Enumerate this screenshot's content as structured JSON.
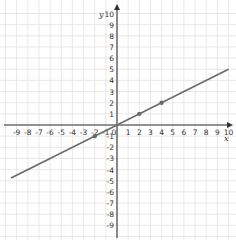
{
  "chart_data": {
    "type": "line",
    "title": "",
    "xlabel": "x",
    "ylabel": "y",
    "xlim": [
      -9.5,
      10.3
    ],
    "ylim": [
      -10,
      10.5
    ],
    "grid": true,
    "x_ticks": [
      -9,
      -8,
      -7,
      -6,
      -5,
      -4,
      -3,
      -2,
      -1,
      0,
      1,
      2,
      3,
      4,
      5,
      6,
      7,
      8,
      9,
      10
    ],
    "y_ticks": [
      10,
      9,
      8,
      7,
      6,
      5,
      4,
      3,
      2,
      1,
      -1,
      -2,
      -3,
      -4,
      -5,
      -6,
      -7,
      -8,
      -9
    ],
    "series": [
      {
        "name": "y = 0.5x",
        "equation": "y = x/2",
        "x": [
          -9.5,
          10
        ],
        "y": [
          -4.75,
          5
        ],
        "color": "#6b6b6b"
      }
    ],
    "points": [
      {
        "x": -2,
        "y": -1
      },
      {
        "x": 2,
        "y": 1
      },
      {
        "x": 4,
        "y": 2
      }
    ],
    "colors": {
      "grid": "#e2e2e2",
      "axis": "#333333",
      "line": "#6b6b6b"
    }
  }
}
